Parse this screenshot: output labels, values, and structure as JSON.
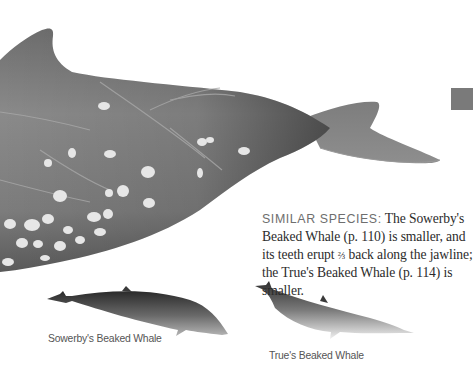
{
  "page": {
    "tab_marker_color": "#7a7a7a"
  },
  "illustrations": [
    {
      "name": "main-whale",
      "subject": "beaked whale (large, cropped)",
      "icon": "whale-illustration"
    },
    {
      "name": "sowerbys-beaked-whale",
      "caption": "Sowerby's Beaked Whale",
      "icon": "whale-illustration"
    },
    {
      "name": "trues-beaked-whale",
      "caption": "True's Beaked Whale",
      "icon": "whale-illustration"
    }
  ],
  "similar_species": {
    "label": "SIMILAR SPECIES:",
    "text_part1": " The Sowerby's Beaked Whale (p. 110) is smaller, and its teeth erupt ",
    "fraction": "⅔",
    "text_part2": " back along the jawline; the True's Beaked Whale (p. 114) is smaller."
  }
}
